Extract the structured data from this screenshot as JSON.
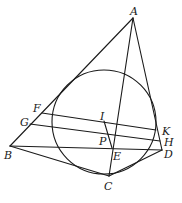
{
  "diagram": {
    "type": "geometry",
    "stroke_color": "#1a1a1a",
    "background": "#ffffff",
    "circle": {
      "cx": 104,
      "cy": 122,
      "r": 52
    },
    "points": {
      "A": {
        "label": "A",
        "x": 133,
        "y": 18,
        "lx": 130,
        "ly": 15
      },
      "B": {
        "label": "B",
        "x": 10,
        "y": 146,
        "lx": 4,
        "ly": 159
      },
      "C": {
        "label": "C",
        "x": 109,
        "y": 176,
        "lx": 104,
        "ly": 190
      },
      "D": {
        "label": "D",
        "x": 162,
        "y": 150,
        "lx": 164,
        "ly": 158
      },
      "E": {
        "label": "E",
        "x": 112,
        "y": 148,
        "lx": 113,
        "ly": 160
      },
      "F": {
        "label": "F",
        "x": 42,
        "y": 113,
        "lx": 33,
        "ly": 112
      },
      "G": {
        "label": "G",
        "x": 30,
        "y": 124,
        "lx": 20,
        "ly": 126
      },
      "H": {
        "label": "H",
        "x": 160,
        "y": 141,
        "lx": 164,
        "ly": 146
      },
      "I": {
        "label": "I",
        "x": 104,
        "y": 121,
        "lx": 100,
        "ly": 120
      },
      "K": {
        "label": "K",
        "x": 156,
        "y": 130,
        "lx": 162,
        "ly": 135
      },
      "P": {
        "label": "P",
        "x": 113,
        "y": 137,
        "lx": 99,
        "ly": 145
      }
    },
    "segments": [
      [
        "A",
        "B"
      ],
      [
        "A",
        "D"
      ],
      [
        "A",
        "C"
      ],
      [
        "B",
        "D"
      ],
      [
        "B",
        "C"
      ],
      [
        "C",
        "D"
      ],
      [
        "F",
        "K"
      ],
      [
        "G",
        "H"
      ],
      [
        "I",
        "E"
      ]
    ]
  }
}
